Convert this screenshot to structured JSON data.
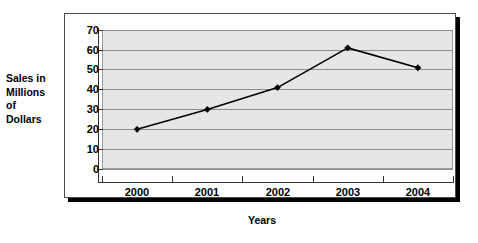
{
  "chart_data": {
    "type": "line",
    "title": "",
    "xlabel": "Years",
    "ylabel": "Sales in Millions of Dollars",
    "ylabel_lines": [
      "Sales in",
      "Millions",
      "of",
      "Dollars"
    ],
    "categories": [
      "2000",
      "2001",
      "2002",
      "2003",
      "2004"
    ],
    "values": [
      20,
      30,
      41,
      61,
      51
    ],
    "series": [
      {
        "name": "Sales",
        "values": [
          20,
          30,
          41,
          61,
          51
        ],
        "marker": "diamond",
        "color": "#000000"
      }
    ],
    "ylim": [
      0,
      70
    ],
    "yticks": [
      0,
      10,
      20,
      30,
      40,
      50,
      60,
      70
    ],
    "ytick_labels": [
      "0",
      "10",
      "20",
      "30",
      "40",
      "50",
      "60",
      "70"
    ],
    "xtick_labels": [
      "2000",
      "2001",
      "2002",
      "2003",
      "2004"
    ],
    "grid": "horizontal",
    "legend": "none",
    "plot_background": "#e6e6e6",
    "line_color": "#000000",
    "marker_color": "#000000",
    "gridline_color": "#8d8d8d",
    "frame_color": "#4a4a4a",
    "shadow_color": "#000000"
  }
}
